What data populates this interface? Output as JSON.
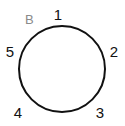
{
  "diagram": {
    "name": "circular-connector-pinout",
    "view_label": "B",
    "background_color": "#ffffff",
    "outline_color": "#111111",
    "outline_stroke_width": 2,
    "label_color": "#111111",
    "view_label_color": "#8a8a8a",
    "circle": {
      "center_x": 62,
      "center_y": 69,
      "radius": 43
    },
    "pins": [
      {
        "id": "1",
        "label": "1",
        "position": "top",
        "x": 58,
        "y": 14
      },
      {
        "id": "2",
        "label": "2",
        "position": "right",
        "x": 114,
        "y": 51
      },
      {
        "id": "3",
        "label": "3",
        "position": "bottom-right",
        "x": 100,
        "y": 112
      },
      {
        "id": "4",
        "label": "4",
        "position": "bottom-left",
        "x": 18,
        "y": 112
      },
      {
        "id": "5",
        "label": "5",
        "position": "left",
        "x": 10,
        "y": 51
      }
    ]
  }
}
